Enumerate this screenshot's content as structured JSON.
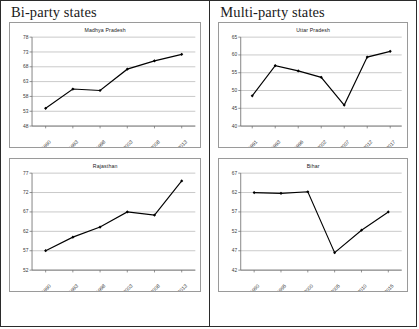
{
  "figure": {
    "groups": [
      {
        "title": "Bi-party states",
        "panels": [
          "madhya_pradesh",
          "rajasthan"
        ]
      },
      {
        "title": "Multi-party states",
        "panels": [
          "uttar_pradesh",
          "bihar"
        ]
      }
    ]
  },
  "chart_data": [
    {
      "key": "madhya_pradesh",
      "type": "line",
      "title": "Madhya Pradesh",
      "xlabel": "",
      "ylabel": "",
      "categories": [
        "1990",
        "1993",
        "1998",
        "2003",
        "2008",
        "2013"
      ],
      "values": [
        54.0,
        60.5,
        60.0,
        67.2,
        70.0,
        72.2
      ],
      "yticks": [
        48,
        53,
        58,
        63,
        68,
        73,
        78
      ],
      "ylim": [
        48,
        78
      ],
      "grid": true,
      "legend": "none",
      "marker": "diamond",
      "color": "#000000"
    },
    {
      "key": "rajasthan",
      "type": "line",
      "title": "Rajasthan",
      "xlabel": "",
      "ylabel": "",
      "categories": [
        "1990",
        "1993",
        "1998",
        "2003",
        "2008",
        "2013"
      ],
      "values": [
        57.0,
        60.5,
        63.1,
        67.0,
        66.2,
        75.0
      ],
      "yticks": [
        52,
        57,
        62,
        67,
        72,
        77
      ],
      "ylim": [
        52,
        77
      ],
      "grid": true,
      "legend": "none",
      "marker": "diamond",
      "color": "#000000"
    },
    {
      "key": "uttar_pradesh",
      "type": "line",
      "title": "Uttar Pradesh",
      "xlabel": "",
      "ylabel": "",
      "categories": [
        "1991",
        "1993",
        "1996",
        "2002",
        "2007",
        "2012",
        "2017"
      ],
      "values": [
        48.5,
        57.0,
        55.5,
        53.7,
        45.9,
        59.4,
        61.0
      ],
      "yticks": [
        40,
        45,
        50,
        55,
        60,
        65
      ],
      "ylim": [
        40,
        65
      ],
      "grid": true,
      "legend": "none",
      "marker": "diamond",
      "color": "#000000"
    },
    {
      "key": "bihar",
      "type": "line",
      "title": "Bihar",
      "xlabel": "",
      "ylabel": "",
      "categories": [
        "1990",
        "1995",
        "2000",
        "2005",
        "2010",
        "2015"
      ],
      "values": [
        62.0,
        61.8,
        62.2,
        46.5,
        52.3,
        57.0
      ],
      "yticks": [
        42,
        47,
        52,
        57,
        62,
        67
      ],
      "ylim": [
        42,
        67
      ],
      "grid": true,
      "legend": "none",
      "marker": "diamond",
      "color": "#000000"
    }
  ]
}
